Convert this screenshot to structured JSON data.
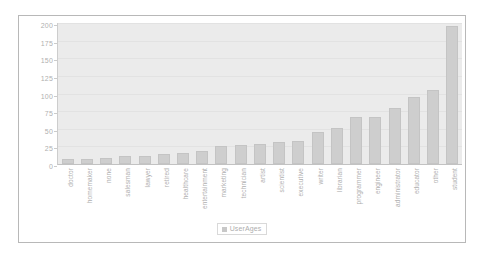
{
  "chart_data": {
    "type": "bar",
    "title": "",
    "subtitle": "",
    "xlabel": "",
    "ylabel": "",
    "ylim": [
      0,
      200
    ],
    "yticks": [
      0,
      25,
      50,
      75,
      100,
      125,
      150,
      175,
      200
    ],
    "grid": true,
    "legend_position": "bottom",
    "categories": [
      "doctor",
      "homemaker",
      "none",
      "salesman",
      "lawyer",
      "retired",
      "healthcare",
      "entertainment",
      "marketing",
      "technician",
      "artist",
      "scientist",
      "executive",
      "writer",
      "librarian",
      "programmer",
      "engineer",
      "administrator",
      "educator",
      "other",
      "student"
    ],
    "series": [
      {
        "name": "UserAges",
        "color": "#b9b9b9",
        "values": [
          7,
          7,
          9,
          12,
          12,
          14,
          16,
          18,
          26,
          27,
          28,
          31,
          32,
          45,
          51,
          66,
          67,
          79,
          95,
          105,
          196
        ]
      }
    ]
  },
  "legend": {
    "swatch_icon": "legend-square-icon",
    "label": "UserAges"
  },
  "colors": {
    "plot_background": "#e2e2e2",
    "bar_fill": "#b9b9b9",
    "bar_border": "#ababab",
    "gridline": "#d6d6d6",
    "axis": "#a8a8a8",
    "tick_text": "#8d8d8d",
    "card_border": "#9a9a9a",
    "page_background": "#ffffff"
  }
}
